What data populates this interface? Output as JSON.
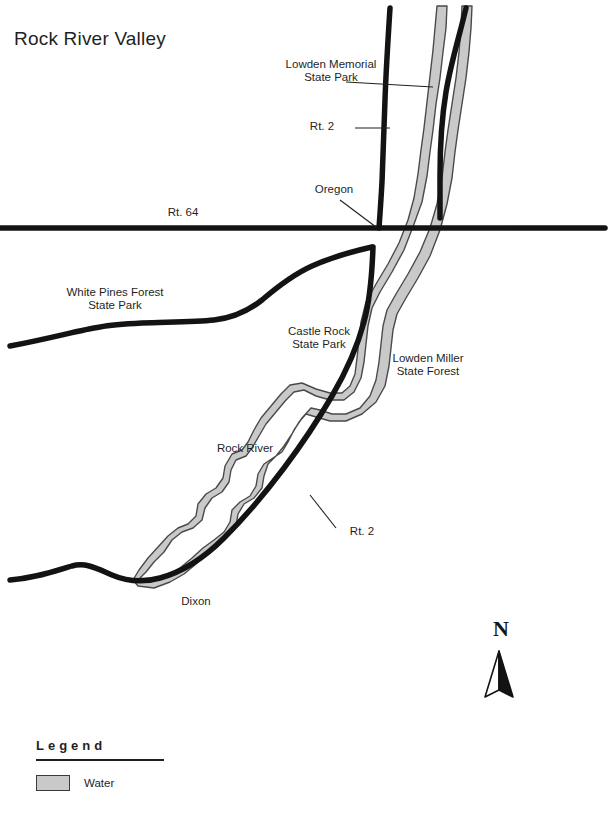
{
  "map": {
    "title": "Rock River Valley",
    "background_color": "#ffffff",
    "ink_color": "#1a1a1a",
    "water_fill_color": "#c9c9c9",
    "water_stroke_color": "#4a4a4a",
    "road_color": "#131313"
  },
  "labels": {
    "lowden_memorial": "Lowden Memorial\nState Park",
    "route_2_north": "Rt. 2",
    "oregon": "Oregon",
    "route_64": "Rt. 64",
    "white_pines": "White Pines Forest\nState Park",
    "castle_rock": "Castle Rock\nState Park",
    "lowden_miller": "Lowden Miller\nState Forest",
    "rock_river": "Rock River",
    "route_2_south": "Rt. 2",
    "dixon": "Dixon"
  },
  "legend": {
    "heading": "Legend",
    "items": [
      {
        "label": "Water",
        "swatch_color": "#c9c9c9"
      }
    ]
  },
  "compass": {
    "letter": "N",
    "direction": "north"
  }
}
